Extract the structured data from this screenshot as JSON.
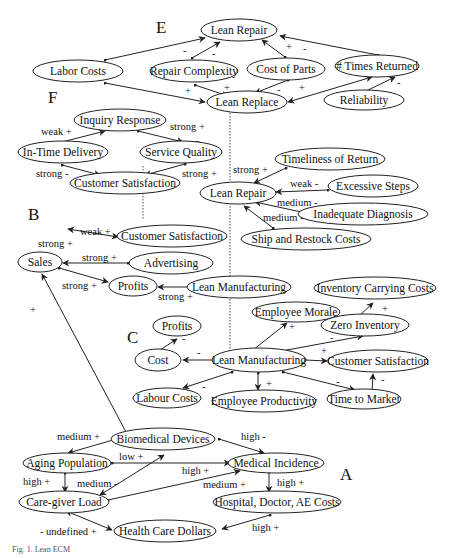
{
  "sections": {
    "A": "A",
    "B": "B",
    "C": "C",
    "D": "D",
    "E": "E",
    "F": "F"
  },
  "nodes": {
    "e_lean_repair": "Lean Repair",
    "e_labor_costs": "Labor Costs",
    "e_repair_complexity": "Repair Complexity",
    "e_cost_of_parts": "Cost of Parts",
    "e_times_returned": "# Times Returned",
    "e_lean_replace": "Lean Replace",
    "e_reliability": "Reliability",
    "f_inquiry_response": "Inquiry Response",
    "f_in_time_delivery": "In-Time Delivery",
    "f_service_quality": "Service Quality",
    "f_customer_satisfaction": "Customer Satisfaction",
    "d_lean_repair": "Lean Repair",
    "d_timeliness": "Timeliness of Return",
    "d_excessive_steps": "Excessive Steps",
    "d_inadequate_diagnosis": "Inadequate Diagnosis",
    "d_ship_restock": "Ship and Restock Costs",
    "b_sales": "Sales",
    "b_customer_satisfaction": "Customer Satisfaction",
    "b_advertising": "Advertising",
    "b_profits": "Profits",
    "b_lean_manufacturing": "Lean Manufacturing",
    "c_inventory_carrying": "Inventory Carrying Costs",
    "c_employee_morale": "Employee Morale",
    "c_zero_inventory": "Zero Inventory",
    "c_profits": "Profits",
    "c_cost": "Cost",
    "c_lean_manufacturing": "Lean Manufacturing",
    "c_customer_satisfaction": "Customer Satisfaction",
    "c_labour_costs": "Labour Costs",
    "c_employee_productivity": "Employee Productivity",
    "c_time_to_market": "Time to Market",
    "a_biomedical_devices": "Biomedical Devices",
    "a_aging_population": "Aging Population",
    "a_medical_incidence": "Medical Incidence",
    "a_caregiver_load": "Care-giver Load",
    "a_hospital_costs": "Hospital, Doctor, AE Costs",
    "a_health_care_dollars": "Health Care Dollars"
  },
  "edge_labels": {
    "e1": "-",
    "e2": "-",
    "e3": "+",
    "e4": "-",
    "e5": "+",
    "e6": "+",
    "e7": "-",
    "e8": "+",
    "e9": "-",
    "f1": "weak +",
    "f2": "strong +",
    "f3": "strong -",
    "f4": "strong +",
    "d1": "strong +",
    "d2": "weak -",
    "d3": "medium -",
    "d4": "medium -",
    "b1": "strong +",
    "b2": "weak +",
    "b3": "strong +",
    "b4": "strong +",
    "b5": "strong +",
    "b6": "+",
    "c1": "+",
    "c2": "+",
    "c3": "-",
    "c4": "-",
    "c5": "-",
    "c6": "+",
    "c7": "-",
    "c8": "+",
    "c9": "-",
    "c10": "-",
    "a1": "medium +",
    "a2": "high -",
    "a3": "low +",
    "a4": "high +",
    "a5": "medium -",
    "a6": "high +",
    "a7": "medium +",
    "a8": "high +",
    "a9": "- undefined +",
    "a10": "high +"
  },
  "caption": "Fig. 1. Lean ECM"
}
